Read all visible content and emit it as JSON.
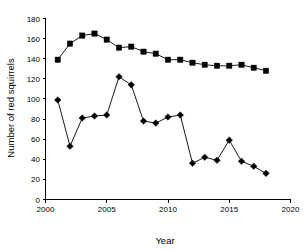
{
  "chart_data": {
    "type": "line",
    "title": "",
    "xlabel": "Year",
    "ylabel": "Number of red squirrels",
    "xlim": [
      2000,
      2020
    ],
    "ylim": [
      0,
      180
    ],
    "xticks": [
      2000,
      2005,
      2010,
      2015,
      2020
    ],
    "yticks": [
      0,
      20,
      40,
      60,
      80,
      100,
      120,
      140,
      160,
      180
    ],
    "xtick_labels": [
      "2000",
      "2005",
      "2010",
      "2015",
      "2020"
    ],
    "ytick_labels": [
      "0",
      "20",
      "40",
      "60",
      "80",
      "100",
      "120",
      "140",
      "160",
      "180"
    ],
    "grid": false,
    "legend": "none",
    "x": [
      2001,
      2002,
      2003,
      2004,
      2005,
      2006,
      2007,
      2008,
      2009,
      2010,
      2011,
      2012,
      2013,
      2014,
      2015,
      2016,
      2017,
      2018
    ],
    "series": [
      {
        "name": "square-series",
        "marker": "square",
        "color": "#000000",
        "values": [
          139,
          155,
          163,
          165,
          159,
          151,
          152,
          147,
          145,
          139,
          139,
          136,
          134,
          133,
          133,
          134,
          131,
          128
        ]
      },
      {
        "name": "diamond-series",
        "marker": "diamond",
        "color": "#000000",
        "values": [
          99,
          53,
          81,
          83,
          84,
          122,
          114,
          78,
          76,
          82,
          84,
          36,
          42,
          39,
          59,
          38,
          33,
          26
        ]
      }
    ]
  },
  "axes": {
    "x_title": "Year",
    "y_title": "Number of red squirrels"
  }
}
